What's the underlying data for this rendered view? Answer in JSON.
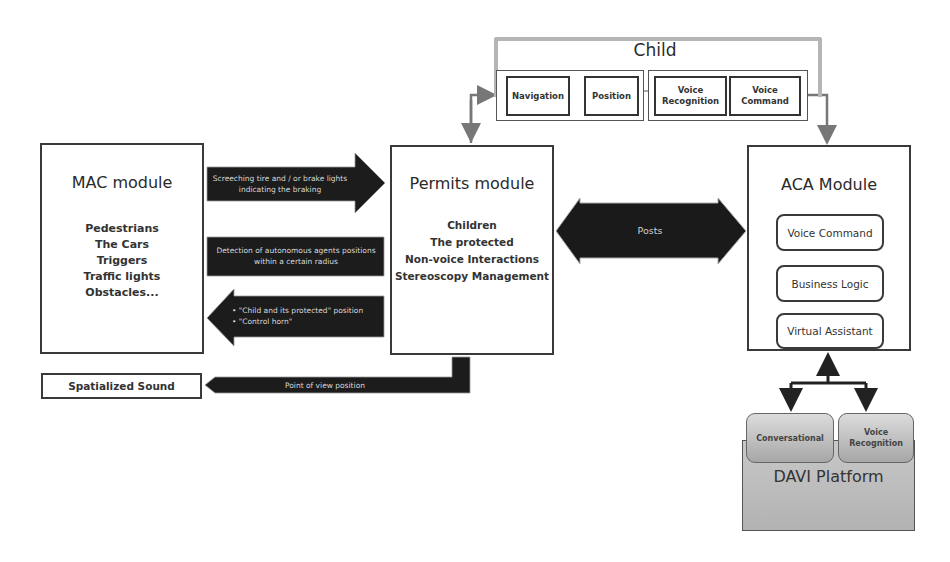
{
  "child": {
    "title": "Child",
    "items": [
      {
        "label": "Navigation"
      },
      {
        "label": "Position"
      },
      {
        "label": "Voice Recognition"
      },
      {
        "label": "Voice Command"
      }
    ]
  },
  "mac_module": {
    "title": "MAC module",
    "items": [
      "Pedestrians",
      "The Cars",
      "Triggers",
      "Traffic lights",
      "Obstacles..."
    ]
  },
  "permits_module": {
    "title": "Permits module",
    "items": [
      "Children",
      "The protected",
      "Non-voice Interactions",
      "Stereoscopy Management"
    ]
  },
  "aca_module": {
    "title": "ACA Module",
    "items": [
      {
        "label": "Voice Command"
      },
      {
        "label": "Business Logic"
      },
      {
        "label": "Virtual Assistant"
      }
    ]
  },
  "arrows": {
    "screeching": "Screeching tire and / or brake lights indicating the braking",
    "detection": "Detection of autonomous agents positions within a certain radius",
    "child_protected_1": "• \"Child and its protected\" position",
    "child_protected_2": "• \"Control horn\"",
    "posts": "Posts",
    "point_of_view": "Point of view position"
  },
  "spatialized_sound": {
    "label": "Spatialized Sound"
  },
  "davi_platform": {
    "title": "DAVI Platform",
    "items": [
      {
        "label": "Conversational"
      },
      {
        "label": "Voice Recognition"
      }
    ]
  },
  "colors": {
    "dark_arrow": "#1c1c1c",
    "gray_frame": "#b5b5b5",
    "davi_bg": "#bdbdbd",
    "border": "#3a3a3a"
  }
}
